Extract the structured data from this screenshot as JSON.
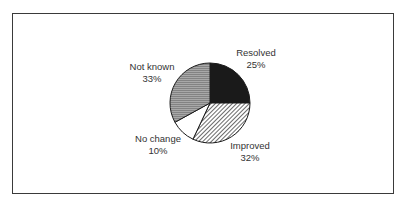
{
  "chart_data": {
    "type": "pie",
    "title": "",
    "categories": [
      "Resolved",
      "Improved",
      "No change",
      "Not known"
    ],
    "values": [
      25,
      32,
      10,
      33
    ],
    "unit": "%",
    "start_angle_deg": 0,
    "direction": "clockwise",
    "legend": "none (inline labels)",
    "slices": [
      {
        "label": "Resolved",
        "value": 25,
        "pct_label": "25%",
        "fill": "solid",
        "color": "#1a1a1a"
      },
      {
        "label": "Improved",
        "value": 32,
        "pct_label": "32%",
        "fill": "diagonal-hatch",
        "color": "#333333"
      },
      {
        "label": "No change",
        "value": 10,
        "pct_label": "10%",
        "fill": "solid",
        "color": "#ffffff"
      },
      {
        "label": "Not known",
        "value": 33,
        "pct_label": "33%",
        "fill": "horizontal-lines",
        "color": "#9a9a9a"
      }
    ]
  },
  "labels": {
    "resolved": {
      "name": "Resolved",
      "pct": "25%"
    },
    "improved": {
      "name": "Improved",
      "pct": "32%"
    },
    "no_change": {
      "name": "No change",
      "pct": "10%"
    },
    "not_known": {
      "name": "Not known",
      "pct": "33%"
    }
  }
}
